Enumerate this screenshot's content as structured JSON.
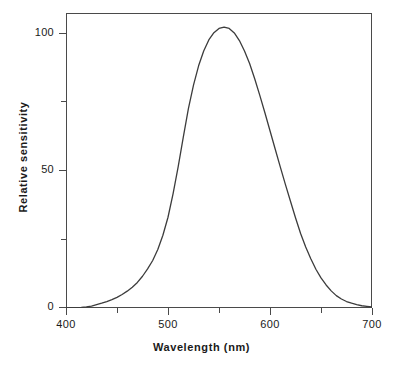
{
  "chart_data": {
    "type": "line",
    "title": "",
    "subtitle": "",
    "xlabel": "Wavelength (nm)",
    "ylabel": "Relative sensitivity",
    "xlim": [
      400,
      700
    ],
    "ylim": [
      0,
      105
    ],
    "grid": false,
    "legend": null,
    "x_ticks_major": [
      400,
      500,
      600,
      700
    ],
    "x_tick_labels": [
      "400",
      "500",
      "600",
      "700"
    ],
    "x_ticks_minor": [
      450,
      550,
      650
    ],
    "y_ticks_major": [
      0,
      50,
      100
    ],
    "y_tick_labels": [
      "0",
      "50",
      "100"
    ],
    "y_ticks_minor": [
      25,
      75
    ],
    "line_color": "#3c3c3c",
    "frame_color": "#4a4a4a",
    "background": "#ffffff",
    "series": [
      {
        "name": "Photopic relative sensitivity",
        "x": [
          400,
          405,
          410,
          415,
          420,
          425,
          430,
          435,
          440,
          445,
          450,
          455,
          460,
          465,
          470,
          475,
          480,
          485,
          490,
          495,
          500,
          505,
          510,
          515,
          520,
          525,
          530,
          535,
          540,
          545,
          550,
          555,
          560,
          565,
          570,
          575,
          580,
          585,
          590,
          595,
          600,
          605,
          610,
          615,
          620,
          625,
          630,
          635,
          640,
          645,
          650,
          655,
          660,
          665,
          670,
          675,
          680,
          685,
          690,
          695,
          700
        ],
        "values": [
          0.0,
          0.1,
          0.1,
          0.2,
          0.4,
          0.7,
          1.2,
          1.7,
          2.3,
          3.0,
          3.8,
          4.8,
          6.0,
          7.4,
          9.1,
          11.3,
          13.9,
          16.9,
          20.8,
          25.9,
          32.3,
          40.7,
          50.3,
          60.8,
          71.0,
          79.3,
          86.2,
          91.5,
          95.4,
          98.0,
          99.5,
          100.0,
          99.5,
          97.9,
          95.2,
          91.5,
          87.0,
          81.6,
          75.7,
          69.5,
          63.1,
          56.7,
          50.3,
          44.1,
          38.1,
          32.1,
          26.5,
          21.7,
          17.5,
          13.8,
          10.7,
          8.2,
          6.1,
          4.4,
          3.2,
          2.3,
          1.7,
          1.2,
          0.8,
          0.6,
          0.4
        ]
      }
    ],
    "peak": {
      "x": 555,
      "y": 100
    },
    "annotations": []
  },
  "axes": {
    "x_title": "Wavelength (nm)",
    "y_title": "Relative sensitivity",
    "x_tick_labels": [
      "400",
      "500",
      "600",
      "700"
    ],
    "y_tick_labels": [
      "100",
      "50",
      "0"
    ]
  }
}
